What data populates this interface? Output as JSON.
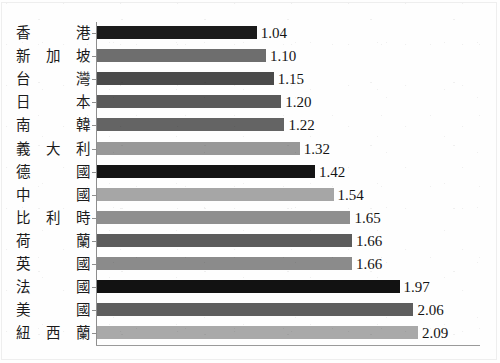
{
  "chart_data": {
    "type": "bar",
    "orientation": "horizontal",
    "title": "",
    "subtitle": "",
    "xlabel": "",
    "ylabel": "",
    "categories": [
      "香 港",
      "新加坡",
      "台 灣",
      "日 本",
      "南 韓",
      "義大利",
      "德 國",
      "中 國",
      "比利時",
      "荷 蘭",
      "英 國",
      "法 國",
      "美 國",
      "紐西蘭"
    ],
    "values": [
      1.04,
      1.1,
      1.15,
      1.2,
      1.22,
      1.32,
      1.42,
      1.54,
      1.65,
      1.66,
      1.66,
      1.97,
      2.06,
      2.09
    ],
    "value_labels": [
      "1.04",
      "1.10",
      "1.15",
      "1.20",
      "1.22",
      "1.32",
      "1.42",
      "1.54",
      "1.65",
      "1.66",
      "1.66",
      "1.97",
      "2.06",
      "2.09"
    ],
    "bar_colors": [
      "#1b1b1b",
      "#6e6e6e",
      "#4a4a4a",
      "#5a5a5a",
      "#646464",
      "#989898",
      "#141414",
      "#a6a6a6",
      "#8f8f8f",
      "#5c5c5c",
      "#8b8b8b",
      "#121212",
      "#5e5e5e",
      "#a9a9a9"
    ],
    "xlim": [
      0,
      2.09
    ],
    "ylim": null,
    "grid": false,
    "legend": null,
    "legend_position": "none",
    "tick_labels_x": [],
    "tick_labels_y": [
      "香 港",
      "新加坡",
      "台 灣",
      "日 本",
      "南 韓",
      "義大利",
      "德 國",
      "中 國",
      "比利時",
      "荷 蘭",
      "英 國",
      "法 國",
      "美 國",
      "紐西蘭"
    ],
    "annotations": [],
    "axis_color": "#8e8e8e",
    "background_color": "#ffffff",
    "px_per_unit": 153.6,
    "bar_origin_x": 97
  }
}
